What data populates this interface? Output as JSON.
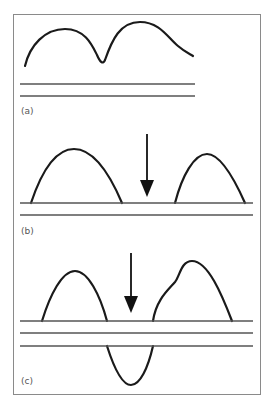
{
  "figure": {
    "panels": [
      {
        "id": "a",
        "label": "(a)"
      },
      {
        "id": "b",
        "label": "(b)"
      },
      {
        "id": "c",
        "label": "(c)"
      }
    ],
    "colors": {
      "curve": "#1a1a1a",
      "line": "#555555",
      "frame": "#8a8a8a",
      "arrow": "#111111"
    }
  }
}
